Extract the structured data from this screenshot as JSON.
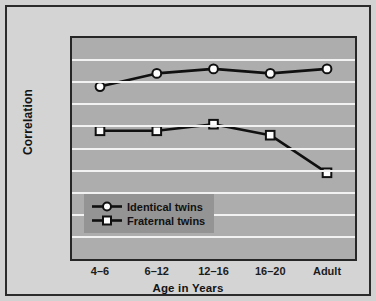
{
  "chart_data": {
    "type": "line",
    "title": "",
    "xlabel": "Age in Years",
    "ylabel": "Correlation",
    "categories": [
      "4–6",
      "6–12",
      "12–16",
      "16–20",
      "Adult"
    ],
    "ylim": [
      0.0,
      1.0
    ],
    "ytick_labels": [
      "1.00",
      ".90",
      ".80",
      ".70",
      ".60",
      ".50",
      ".40",
      ".30",
      ".20",
      ".10",
      ".00"
    ],
    "ytick_values": [
      1.0,
      0.9,
      0.8,
      0.7,
      0.6,
      0.5,
      0.4,
      0.3,
      0.2,
      0.1,
      0.0
    ],
    "grid": true,
    "legend_position": "inside-lower-left",
    "series": [
      {
        "name": "Identical twins",
        "marker": "circle",
        "values": [
          0.78,
          0.84,
          0.86,
          0.84,
          0.86
        ]
      },
      {
        "name": "Fraternal twins",
        "marker": "square",
        "values": [
          0.58,
          0.58,
          0.61,
          0.56,
          0.39
        ]
      }
    ],
    "colors": {
      "line": "#101010",
      "marker_fill": "#fdfdfd",
      "plot_background": "#adadad",
      "gridline": "#f2f2f2",
      "page_background": "#d4d4d4",
      "legend_background": "#949494",
      "frame_border": "#2b2b2b"
    }
  }
}
